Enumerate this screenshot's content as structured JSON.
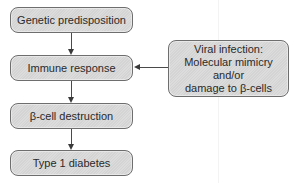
{
  "diagram": {
    "nodes": [
      {
        "id": "genetic",
        "label": "Genetic predisposition"
      },
      {
        "id": "immune",
        "label": "Immune response"
      },
      {
        "id": "beta_destruction",
        "label": "β-cell destruction"
      },
      {
        "id": "t1d",
        "label": "Type 1 diabetes"
      },
      {
        "id": "viral",
        "label_lines": [
          "Viral infection:",
          "Molecular mimicry",
          "and/or",
          "damage to β-cells"
        ]
      }
    ],
    "edges": [
      {
        "from": "genetic",
        "to": "immune"
      },
      {
        "from": "immune",
        "to": "beta_destruction"
      },
      {
        "from": "beta_destruction",
        "to": "t1d"
      },
      {
        "from": "viral",
        "to": "immune"
      }
    ],
    "colors": {
      "box_fill": "#d8d8d8",
      "box_border": "#6e6e6e",
      "arrow": "#3a3a3a",
      "text": "#2a2a2a"
    }
  }
}
